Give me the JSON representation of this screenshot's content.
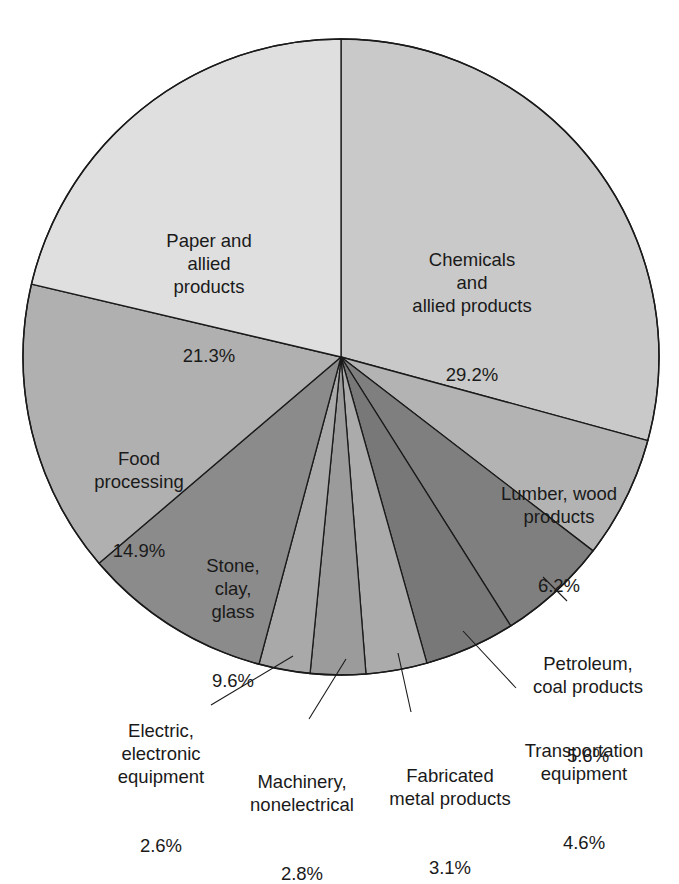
{
  "chart_data": {
    "type": "pie",
    "title": "",
    "start_angle_deg": 0,
    "direction": "clockwise",
    "slices": [
      {
        "label": "Chemicals and allied products",
        "value": 29.2,
        "display": "29.2%",
        "color": "#c9c9c9"
      },
      {
        "label": "Lumber, wood products",
        "value": 6.2,
        "display": "6.2%",
        "color": "#b3b3b3"
      },
      {
        "label": "Petroleum, coal products",
        "value": 5.6,
        "display": "5.6%",
        "color": "#7f7f7f"
      },
      {
        "label": "Transportation equipment",
        "value": 4.6,
        "display": "4.6%",
        "color": "#787878"
      },
      {
        "label": "Fabricated metal products",
        "value": 3.1,
        "display": "3.1%",
        "color": "#ababab"
      },
      {
        "label": "Machinery, nonelectrical",
        "value": 2.8,
        "display": "2.8%",
        "color": "#9b9b9b"
      },
      {
        "label": "Electric, electronic equipment",
        "value": 2.6,
        "display": "2.6%",
        "color": "#a9a9a9"
      },
      {
        "label": "Stone, clay, glass",
        "value": 9.6,
        "display": "9.6%",
        "color": "#8b8b8b"
      },
      {
        "label": "Food processing",
        "value": 14.9,
        "display": "14.9%",
        "color": "#b0b0b0"
      },
      {
        "label": "Paper and allied products",
        "value": 21.3,
        "display": "21.3%",
        "color": "#dfdfdf"
      }
    ]
  },
  "labels": {
    "chemicals": {
      "text": "Chemicals\nand\nallied products",
      "pct": "29.2%"
    },
    "paper": {
      "text": "Paper and\nallied\nproducts",
      "pct": "21.3%"
    },
    "food": {
      "text": "Food\nprocessing",
      "pct": "14.9%"
    },
    "stone": {
      "text": "Stone,\nclay,\nglass",
      "pct": "9.6%"
    },
    "lumber": {
      "text": "Lumber, wood\nproducts",
      "pct": "6.2%"
    },
    "petroleum": {
      "text": "Petroleum,\ncoal products",
      "pct": "5.6%"
    },
    "transportation": {
      "text": "Transportation\nequipment",
      "pct": "4.6%"
    },
    "fabricated": {
      "text": "Fabricated\nmetal products",
      "pct": "3.1%"
    },
    "machinery": {
      "text": "Machinery,\nnonelectrical",
      "pct": "2.8%"
    },
    "electric": {
      "text": "Electric,\nelectronic\nequipment",
      "pct": "2.6%"
    }
  },
  "colors": {
    "outline": "#1a1a1a",
    "text": "#1a1a1a",
    "background": "#ffffff"
  }
}
